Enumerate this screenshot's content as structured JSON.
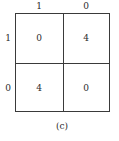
{
  "matrix": {
    "column_headers": [
      "1",
      "0"
    ],
    "row_headers": [
      "1",
      "0"
    ],
    "cells": [
      [
        "0",
        "4"
      ],
      [
        "4",
        "0"
      ]
    ]
  },
  "caption": "(c)"
}
